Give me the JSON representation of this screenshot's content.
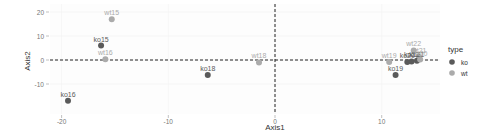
{
  "chart_data": {
    "type": "scatter",
    "title": "",
    "xlabel": "Axis1",
    "ylabel": "Axis2",
    "xlim": [
      -20.6,
      15.8
    ],
    "ylim": [
      -21,
      23
    ],
    "x_ticks": [
      -20,
      -10,
      0,
      10
    ],
    "y_ticks": [
      20,
      10,
      0,
      -10
    ],
    "grid": true,
    "reference_lines": {
      "x": 0,
      "y": 0,
      "style": "dashed"
    },
    "legend": {
      "title": "type",
      "position": "right",
      "entries": [
        {
          "label": "ko",
          "color": "#5a5a5a"
        },
        {
          "label": "wt",
          "color": "#ababab"
        }
      ]
    },
    "points": [
      {
        "label": "wt15",
        "type": "wt",
        "x": -15.3,
        "y": 17.0
      },
      {
        "label": "ko15",
        "type": "ko",
        "x": -16.3,
        "y": 6.0
      },
      {
        "label": "wt16",
        "type": "wt",
        "x": -15.9,
        "y": 0.3
      },
      {
        "label": "ko16",
        "type": "ko",
        "x": -19.4,
        "y": -17.0
      },
      {
        "label": "ko18",
        "type": "ko",
        "x": -6.3,
        "y": -6.3
      },
      {
        "label": "wt18",
        "type": "wt",
        "x": -1.5,
        "y": -1.0
      },
      {
        "label": "wt19",
        "type": "wt",
        "x": 10.7,
        "y": -0.8
      },
      {
        "label": "ko19",
        "type": "ko",
        "x": 11.3,
        "y": -6.3
      },
      {
        "label": "wt22",
        "type": "wt",
        "x": 13.0,
        "y": 4.0
      },
      {
        "label": "wt21",
        "type": "wt",
        "x": 13.5,
        "y": 1.3
      },
      {
        "label": "ko22",
        "type": "ko",
        "x": 12.8,
        "y": -0.6
      },
      {
        "label": "ko21",
        "type": "ko",
        "x": 13.3,
        "y": -0.3
      },
      {
        "label": "wt20",
        "type": "wt",
        "x": 13.6,
        "y": 0.2
      },
      {
        "label": "ko20",
        "type": "ko",
        "x": 12.4,
        "y": -0.8
      }
    ]
  }
}
